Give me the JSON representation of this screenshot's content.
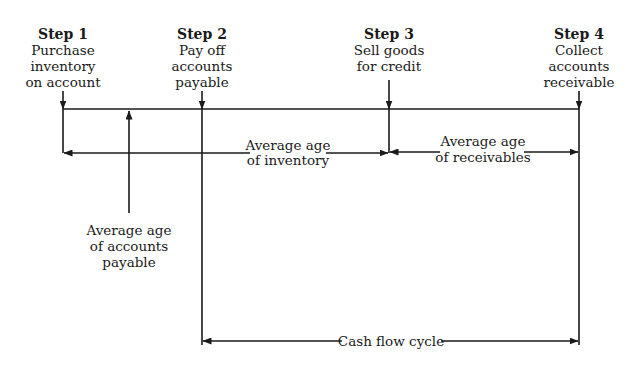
{
  "diagram": {
    "steps": [
      {
        "title": "Step 1",
        "lines": [
          "Purchase",
          "inventory",
          "on account"
        ]
      },
      {
        "title": "Step 2",
        "lines": [
          "Pay off",
          "accounts",
          "payable"
        ]
      },
      {
        "title": "Step 3",
        "lines": [
          "Sell goods",
          "for credit"
        ]
      },
      {
        "title": "Step 4",
        "lines": [
          "Collect",
          "accounts",
          "receivable"
        ]
      }
    ],
    "spans": {
      "inventory": [
        "Average age",
        "of inventory"
      ],
      "receivables": [
        "Average age",
        "of receivables"
      ],
      "payable": [
        "Average age",
        "of accounts",
        "payable"
      ],
      "cash_flow": "Cash flow cycle"
    },
    "colors": {
      "ink": "#1a1a1a",
      "background": "#ffffff"
    }
  }
}
